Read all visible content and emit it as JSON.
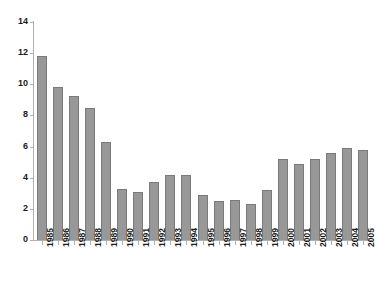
{
  "chart_data": {
    "type": "bar",
    "title": "",
    "xlabel": "",
    "ylabel": "",
    "ylim": [
      0,
      14
    ],
    "yticks": [
      0,
      2,
      4,
      6,
      8,
      10,
      12,
      14
    ],
    "grid": false,
    "legend": null,
    "bar_color": "#989898",
    "bar_edge_color": "#7a7a7a",
    "axis_color": "#b0b0b0",
    "categories": [
      "1985",
      "1986",
      "1987",
      "1988",
      "1989",
      "1990",
      "1991",
      "1992",
      "1993",
      "1994",
      "1995",
      "1996",
      "1997",
      "1998",
      "1999",
      "2000",
      "2001",
      "2002",
      "2003",
      "2004",
      "2005"
    ],
    "values": [
      11.8,
      9.8,
      9.25,
      8.5,
      6.3,
      3.3,
      3.1,
      3.7,
      4.2,
      4.2,
      2.9,
      2.5,
      2.6,
      2.3,
      3.2,
      5.2,
      4.9,
      5.2,
      5.6,
      5.9,
      5.8
    ]
  }
}
